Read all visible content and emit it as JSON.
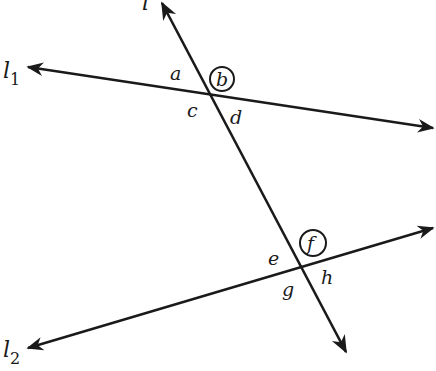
{
  "diagram": {
    "stroke_color": "#1a1a1a",
    "lines": {
      "transversal": {
        "label": "l",
        "subscript": ""
      },
      "line1": {
        "label": "l",
        "subscript": "1"
      },
      "line2": {
        "label": "l",
        "subscript": "2"
      }
    },
    "angles_top": {
      "a": "a",
      "b": "b",
      "c": "c",
      "d": "d"
    },
    "angles_bottom": {
      "e": "e",
      "f": "f",
      "g": "g",
      "h": "h"
    },
    "circled_angles": [
      "b",
      "f"
    ]
  }
}
